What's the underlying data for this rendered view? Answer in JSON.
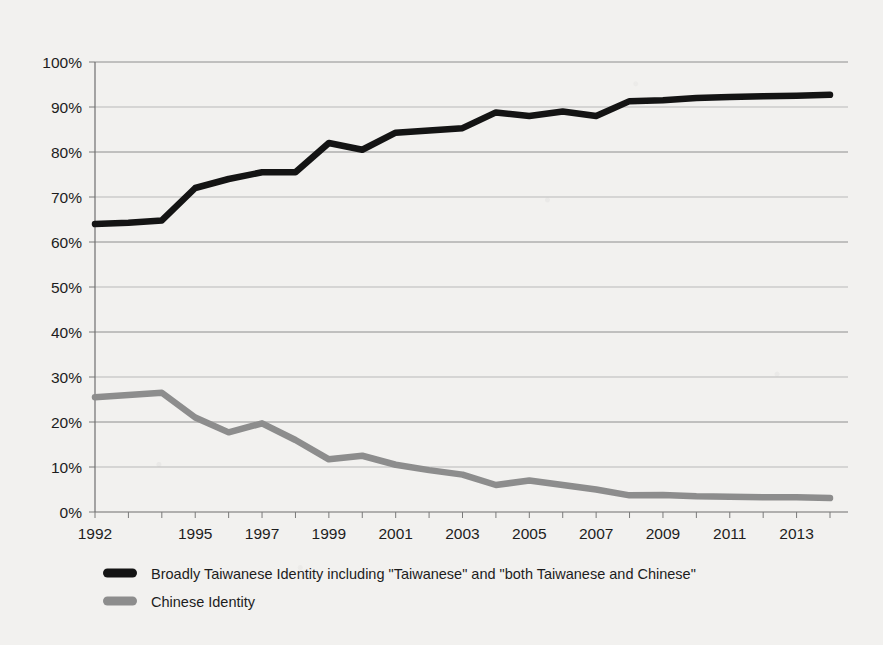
{
  "chart_data": {
    "type": "line",
    "title": "",
    "subtitle": "",
    "xlabel": "",
    "ylabel": "",
    "x": [
      1992,
      1993,
      1994,
      1995,
      1996,
      1997,
      1998,
      1999,
      2000,
      2001,
      2002,
      2003,
      2004,
      2005,
      2006,
      2007,
      2008,
      2009,
      2010,
      2011,
      2012,
      2013,
      2014
    ],
    "tick_labels_x": [
      "1992",
      "1995",
      "1997",
      "1999",
      "2001",
      "2003",
      "2005",
      "2007",
      "2009",
      "2011",
      "2013"
    ],
    "tick_labels_y": [
      "0%",
      "10%",
      "20%",
      "30%",
      "40%",
      "50%",
      "60%",
      "70%",
      "80%",
      "90%",
      "100%"
    ],
    "xlim": [
      1992,
      2014
    ],
    "ylim": [
      0,
      100
    ],
    "y_tick_step": 10,
    "grid": "horizontal",
    "legend_position": "bottom-left",
    "series": [
      {
        "name": "Broadly Taiwanese Identity including \"Taiwanese\" and \"both Taiwanese and Chinese\"",
        "color": "#141414",
        "stroke_width": 6.5,
        "values": [
          64.0,
          64.3,
          64.8,
          72.0,
          74.0,
          75.5,
          75.5,
          82.0,
          80.5,
          84.3,
          84.8,
          85.3,
          88.8,
          88.0,
          89.0,
          88.0,
          91.3,
          91.5,
          92.0,
          92.2,
          92.4,
          92.5,
          92.7
        ]
      },
      {
        "name": "Chinese Identity",
        "color": "#8d8d8d",
        "stroke_width": 6.5,
        "values": [
          25.5,
          26.0,
          26.5,
          21.0,
          17.7,
          19.7,
          16.0,
          11.7,
          12.5,
          10.5,
          9.3,
          8.3,
          6.0,
          7.0,
          6.0,
          5.0,
          3.7,
          3.8,
          3.5,
          3.4,
          3.3,
          3.3,
          3.1
        ]
      }
    ],
    "legend": [
      {
        "label": "Broadly Taiwanese Identity including \"Taiwanese\" and \"both Taiwanese and Chinese\"",
        "color": "#141414"
      },
      {
        "label": "Chinese Identity",
        "color": "#8d8d8d"
      }
    ]
  }
}
